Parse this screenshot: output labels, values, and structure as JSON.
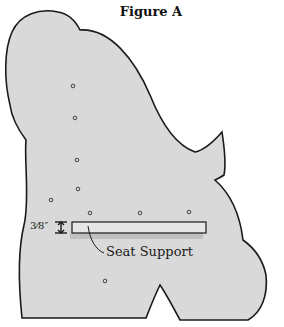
{
  "figure": {
    "title": "Figure A",
    "callout_label": "Seat Support",
    "dimension_label": "3⁄8″",
    "colors": {
      "panel_fill": "#d9d9d9",
      "outline": "#1a1a1a",
      "support_fill": "#e6e6e6",
      "background": "#ffffff"
    },
    "holes": [
      {
        "x": 73,
        "y": 86
      },
      {
        "x": 75,
        "y": 118
      },
      {
        "x": 77,
        "y": 160
      },
      {
        "x": 78,
        "y": 189
      },
      {
        "x": 51,
        "y": 200
      },
      {
        "x": 90,
        "y": 213
      },
      {
        "x": 140,
        "y": 213
      },
      {
        "x": 189,
        "y": 212
      },
      {
        "x": 105,
        "y": 281
      }
    ]
  }
}
